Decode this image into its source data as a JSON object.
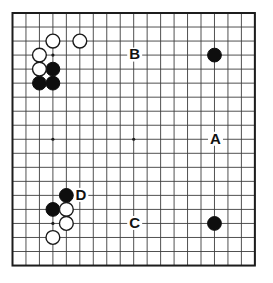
{
  "board": {
    "size": 19,
    "star_points": [
      [
        4,
        4
      ],
      [
        10,
        4
      ],
      [
        16,
        4
      ],
      [
        4,
        10
      ],
      [
        10,
        10
      ],
      [
        16,
        10
      ],
      [
        4,
        16
      ],
      [
        10,
        16
      ],
      [
        16,
        16
      ]
    ],
    "black_stones": [
      [
        16,
        4
      ],
      [
        4,
        5
      ],
      [
        3,
        6
      ],
      [
        4,
        6
      ],
      [
        5,
        14
      ],
      [
        4,
        15
      ],
      [
        16,
        16
      ]
    ],
    "white_stones": [
      [
        4,
        3
      ],
      [
        6,
        3
      ],
      [
        3,
        4
      ],
      [
        3,
        5
      ],
      [
        5,
        15
      ],
      [
        5,
        16
      ],
      [
        4,
        17
      ]
    ],
    "labels": [
      {
        "text": "A",
        "col": 16,
        "row": 10
      },
      {
        "text": "B",
        "col": 10,
        "row": 4
      },
      {
        "text": "C",
        "col": 10,
        "row": 16
      },
      {
        "text": "D",
        "col": 6,
        "row": 14
      }
    ],
    "colors": {
      "background": "#ffffff",
      "grid_line": "#3d3d3d",
      "border": "#1c1c1c",
      "black_stone": "#0e0e0e",
      "white_stone": "#ffffff",
      "stone_outline": "#1a1a1a",
      "label_text": "#111111"
    }
  }
}
